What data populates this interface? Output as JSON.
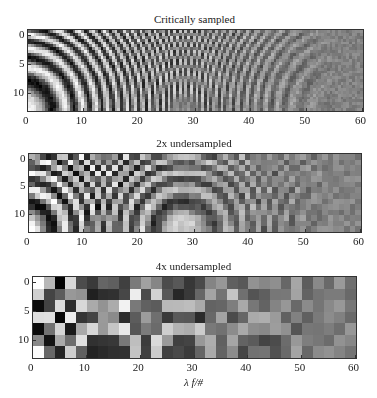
{
  "chart_data": [
    {
      "type": "heatmap",
      "title": "Critically sampled",
      "xlabel": "",
      "ylabel": "",
      "xticks": [
        0,
        10,
        20,
        30,
        40,
        50,
        60
      ],
      "yticks": [
        0,
        5,
        10
      ],
      "xlim": [
        0,
        60
      ],
      "ylim": [
        13,
        -1
      ],
      "colormap": "gray",
      "grid": false,
      "pixel_step": 0.5,
      "box": {
        "left": 27,
        "top": 29,
        "right": 362,
        "bottom": 110
      }
    },
    {
      "type": "heatmap",
      "title": "2x undersampled",
      "xlabel": "",
      "ylabel": "",
      "xticks": [
        0,
        10,
        20,
        30,
        40,
        50,
        60
      ],
      "yticks": [
        0,
        5,
        10
      ],
      "xlim": [
        0,
        60
      ],
      "ylim": [
        13,
        -1
      ],
      "colormap": "gray",
      "grid": false,
      "pixel_step": 1,
      "box": {
        "left": 28,
        "top": 153,
        "right": 360,
        "bottom": 231
      }
    },
    {
      "type": "heatmap",
      "title": "4x undersampled",
      "xlabel": "λ f/#",
      "ylabel": "",
      "xticks": [
        0,
        10,
        20,
        30,
        40,
        50,
        60
      ],
      "yticks": [
        0,
        5,
        10
      ],
      "xlim": [
        0,
        60
      ],
      "ylim": [
        13,
        -1
      ],
      "colormap": "gray",
      "grid": false,
      "pixel_step": 2,
      "box": {
        "left": 32,
        "top": 276,
        "right": 355,
        "bottom": 357
      }
    }
  ],
  "pattern": {
    "description": "Concentric fringe (chirp) pattern centered near lower-left corner, fringe contrast fading to noise toward the right",
    "center_x": -1,
    "center_y": 13,
    "chirp_k": 0.12,
    "noise": 0.12
  }
}
